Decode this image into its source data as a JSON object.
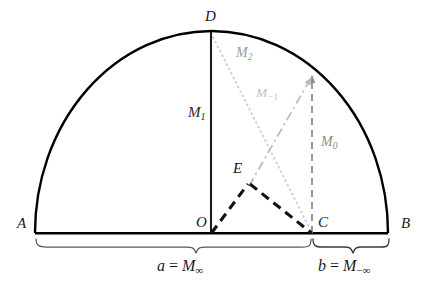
{
  "figure": {
    "type": "geometry-diagram",
    "background_color": "#ffffff",
    "width": 432,
    "height": 290
  },
  "points": [
    {
      "id": "A",
      "label": "A",
      "x": 35,
      "y": 233,
      "label_x": 17,
      "label_y": 216
    },
    {
      "id": "B",
      "label": "B",
      "x": 388,
      "y": 233,
      "label_x": 401,
      "label_y": 216
    },
    {
      "id": "C",
      "label": "C",
      "x": 312,
      "y": 233,
      "label_x": 318,
      "label_y": 215
    },
    {
      "id": "D",
      "label": "D",
      "x": 211,
      "y": 31,
      "label_x": 205,
      "label_y": 9
    },
    {
      "id": "E",
      "label": "E",
      "x": 249,
      "y": 183,
      "label_x": 233,
      "label_y": 161
    },
    {
      "id": "O",
      "label": "O",
      "x": 211,
      "y": 233,
      "label_x": 196,
      "label_y": 215
    }
  ],
  "segments": [
    {
      "name": "arc-ADB",
      "style": "solid-arc",
      "color": "#000000"
    },
    {
      "name": "baseline-AB",
      "style": "solid",
      "color": "#000000"
    },
    {
      "name": "altitude-OD",
      "style": "solid",
      "color": "#1a1a1a"
    },
    {
      "name": "chord-DC",
      "style": "dotted",
      "color": "#cfcfcf"
    },
    {
      "name": "segment-OE",
      "style": "dashed",
      "color": "#111111"
    },
    {
      "name": "segment-EC",
      "style": "dashed",
      "color": "#111111"
    },
    {
      "name": "ray-E-to-arc",
      "style": "dash-dot",
      "color": "#b5b5b5"
    },
    {
      "name": "vertical-C-to-arc",
      "style": "dashed",
      "color": "#8c8c8c"
    }
  ],
  "mean_labels": [
    {
      "id": "M1",
      "base": "M",
      "sub": "1",
      "x": 188,
      "y": 105,
      "tone": "dark"
    },
    {
      "id": "M2",
      "base": "M",
      "sub": "2",
      "x": 236,
      "y": 46,
      "tone": "gray"
    },
    {
      "id": "Mm1",
      "base": "M",
      "sub": "−1",
      "x": 256,
      "y": 86,
      "tone": "gray-light"
    },
    {
      "id": "M0",
      "base": "M",
      "sub": "0",
      "x": 321,
      "y": 135,
      "tone": "mid"
    }
  ],
  "braces": [
    {
      "id": "brace-a",
      "from_point": "A",
      "to_point": "C",
      "label_prefix": "a",
      "label_equals": "=",
      "label_base": "M",
      "label_sub": "∞",
      "label_text": "a = M∞",
      "label_x": 196,
      "label_y": 258
    },
    {
      "id": "brace-b",
      "from_point": "C",
      "to_point": "B",
      "label_prefix": "b",
      "label_equals": "=",
      "label_base": "M",
      "label_sub": "−∞",
      "label_text": "b = M−∞",
      "label_x": 363,
      "label_y": 258
    }
  ],
  "colors": {
    "stroke_dark": "#000000",
    "stroke_gray": "#8c8c8c",
    "stroke_light": "#c7c7c7",
    "text_dark": "#1a1a1a",
    "background": "#ffffff"
  }
}
